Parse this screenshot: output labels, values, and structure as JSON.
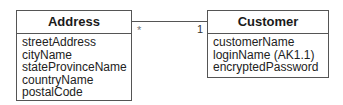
{
  "diagram": {
    "classes": [
      {
        "name": "Address",
        "attributes": [
          "streetAddress",
          "cityName",
          "stateProvinceName",
          "countryName",
          "postalCode"
        ]
      },
      {
        "name": "Customer",
        "attributes": [
          "customerName",
          "loginName (AK1.1)",
          "encryptedPassword"
        ]
      }
    ],
    "association": {
      "from": "Address",
      "to": "Customer",
      "from_multiplicity": "*",
      "to_multiplicity": "1"
    }
  }
}
